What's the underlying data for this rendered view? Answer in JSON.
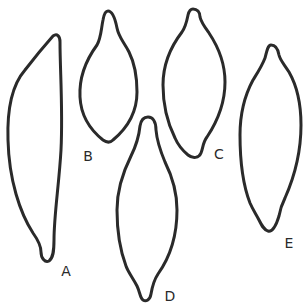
{
  "figure": {
    "stroke_color": "#2a2a2a",
    "background_color": "#ffffff"
  },
  "shapes": [
    {
      "id": "A",
      "label": "A",
      "label_pos": {
        "x": 66,
        "y": 271
      }
    },
    {
      "id": "B",
      "label": "B",
      "label_pos": {
        "x": 88,
        "y": 156
      }
    },
    {
      "id": "C",
      "label": "C",
      "label_pos": {
        "x": 219,
        "y": 154
      }
    },
    {
      "id": "D",
      "label": "D",
      "label_pos": {
        "x": 170,
        "y": 296
      }
    },
    {
      "id": "E",
      "label": "E",
      "label_pos": {
        "x": 289,
        "y": 243
      }
    }
  ]
}
